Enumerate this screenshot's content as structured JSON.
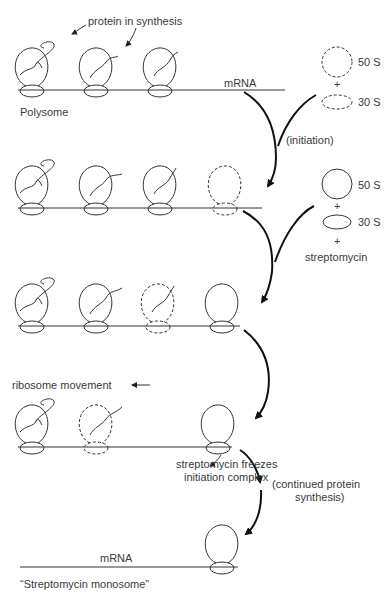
{
  "labels": {
    "protein_in_synthesis": "protein in synthesis",
    "mrna_top": "mRNA",
    "polysome": "Polysome",
    "subunit_50s_a": "50 S",
    "plus_a": "+",
    "subunit_30s_a": "30 S",
    "initiation": "(initiation)",
    "subunit_50s_b": "50 S",
    "plus_b1": "+",
    "subunit_30s_b": "30 S",
    "plus_b2": "+",
    "streptomycin": "streptomycin",
    "ribosome_movement": "ribosome movement",
    "freezes_line1": "streptomycin freezes",
    "freezes_line2": "initiation complex",
    "continued_line1": "(continued protein",
    "continued_line2": "synthesis)",
    "mrna_bottom": "mRNA",
    "monosome": "“Streptomycin monosome”"
  },
  "stages": [
    {
      "name": "polysome",
      "ribosomes": [
        "solid-with-protein",
        "solid-with-protein",
        "solid-with-protein"
      ]
    },
    {
      "name": "initiation",
      "ribosomes": [
        "solid-with-protein",
        "solid-with-protein",
        "solid-with-protein",
        "dashed"
      ]
    },
    {
      "name": "streptomycin-binding",
      "ribosomes": [
        "solid-with-protein",
        "solid-with-protein",
        "dashed-with-protein",
        "solid"
      ]
    },
    {
      "name": "frozen-initiation",
      "ribosomes": [
        "solid-with-protein",
        "dashed-with-protein",
        "solid"
      ]
    },
    {
      "name": "streptomycin-monosome",
      "ribosomes": [
        "solid"
      ]
    }
  ]
}
